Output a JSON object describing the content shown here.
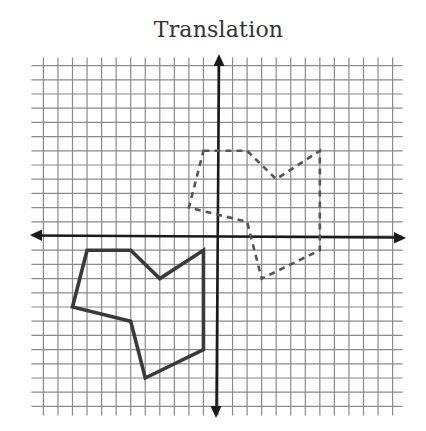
{
  "title": "Translation",
  "plane": {
    "origin_px": [
      218,
      236
    ],
    "unit_px": [
      14.55,
      14.2
    ],
    "grid_min": -12,
    "grid_max": 12,
    "grid_color": "#8a8a8a",
    "axis_color": "#1a1a1a"
  },
  "shapes": {
    "preimage": {
      "style": "solid",
      "color": "#3a3a3a",
      "vertices": [
        [
          -9,
          -1
        ],
        [
          -6,
          -1
        ],
        [
          -4,
          -3
        ],
        [
          -1,
          -1
        ],
        [
          -1,
          -8
        ],
        [
          -5,
          -10
        ],
        [
          -6,
          -6
        ],
        [
          -10,
          -5
        ]
      ]
    },
    "image": {
      "style": "dashed",
      "color": "#555555",
      "vertices": [
        [
          -1,
          6
        ],
        [
          2,
          6
        ],
        [
          4,
          4
        ],
        [
          7,
          6
        ],
        [
          7,
          -1
        ],
        [
          3,
          -3
        ],
        [
          2,
          1
        ],
        [
          -2,
          2
        ]
      ]
    }
  },
  "translation_vector": [
    8,
    7
  ]
}
